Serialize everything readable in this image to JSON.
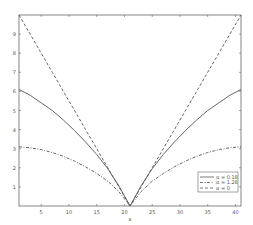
{
  "chart_data": {
    "type": "line",
    "title": "",
    "xlabel": "x",
    "ylabel": "",
    "xlim": [
      1,
      41
    ],
    "ylim": [
      0,
      10
    ],
    "xticks": [
      5,
      10,
      15,
      20,
      25,
      30,
      35,
      40
    ],
    "yticks": [
      1,
      2,
      3,
      4,
      5,
      6,
      7,
      8,
      9
    ],
    "grid": false,
    "legend_position": "lower right",
    "x": [
      1,
      3,
      5,
      7,
      9,
      11,
      13,
      15,
      17,
      19,
      21,
      23,
      25,
      27,
      29,
      31,
      33,
      35,
      37,
      39,
      41
    ],
    "series": [
      {
        "name": "α = 0.18",
        "style": "solid",
        "values": [
          6.1,
          5.8,
          5.4,
          5.0,
          4.5,
          3.95,
          3.35,
          2.7,
          1.95,
          1.05,
          0,
          1.05,
          1.95,
          2.7,
          3.35,
          3.95,
          4.5,
          5.0,
          5.4,
          5.8,
          6.1
        ]
      },
      {
        "name": "α = 1.28",
        "style": "dashdot",
        "values": [
          3.1,
          3.05,
          2.95,
          2.8,
          2.6,
          2.35,
          2.05,
          1.7,
          1.3,
          0.75,
          0,
          0.75,
          1.3,
          1.7,
          2.05,
          2.35,
          2.6,
          2.8,
          2.95,
          3.05,
          3.1
        ]
      },
      {
        "name": "α = 0",
        "style": "dashed",
        "values": [
          10,
          9,
          8,
          7,
          6,
          5,
          4,
          3,
          2,
          1,
          0,
          1,
          2,
          3,
          4,
          5,
          6,
          7,
          8,
          9,
          10
        ]
      }
    ]
  }
}
